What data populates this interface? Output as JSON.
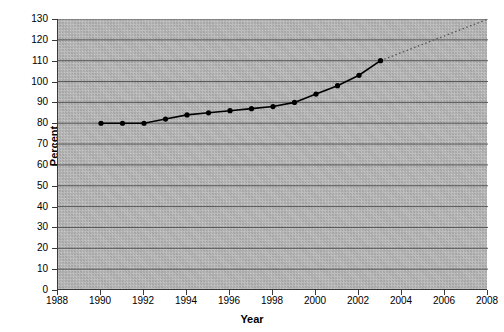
{
  "chart_data": {
    "type": "line",
    "title": "",
    "xlabel": "Year",
    "ylabel": "Percent",
    "xlim": [
      1988,
      2008
    ],
    "ylim": [
      0,
      130
    ],
    "grid": true,
    "legend": false,
    "xticks": [
      "1988",
      "1990",
      "1992",
      "1994",
      "1996",
      "1998",
      "2000",
      "2002",
      "2004",
      "2006",
      "2008"
    ],
    "yticks": [
      "0",
      "10",
      "20",
      "30",
      "40",
      "50",
      "60",
      "70",
      "80",
      "90",
      "100",
      "110",
      "120",
      "130"
    ],
    "series": [
      {
        "name": "Percent",
        "style": "solid-with-markers",
        "color": "#000000",
        "x": [
          1990,
          1991,
          1992,
          1993,
          1994,
          1995,
          1996,
          1997,
          1998,
          1999,
          2000,
          2001,
          2002,
          2003
        ],
        "values": [
          80,
          80,
          80,
          82,
          84,
          85,
          86,
          87,
          88,
          90,
          94,
          98,
          103,
          110
        ]
      },
      {
        "name": "Trend extrapolation",
        "style": "dotted",
        "color": "#555555",
        "x": [
          2003,
          2008
        ],
        "values": [
          110,
          130
        ]
      }
    ]
  },
  "axes": {
    "y_title": "Percent",
    "x_title": "Year"
  }
}
